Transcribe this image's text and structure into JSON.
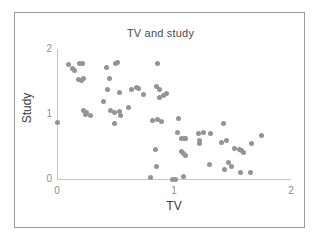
{
  "chart_data": {
    "type": "scatter",
    "title": "TV and study",
    "xlabel": "TV",
    "ylabel": "Study",
    "xlim": [
      0,
      2
    ],
    "ylim": [
      0,
      2
    ],
    "xticks": [
      "0",
      "1",
      "2"
    ],
    "xtick_values": [
      0,
      1,
      2
    ],
    "yticks": [
      "0",
      "1",
      "2"
    ],
    "ytick_values": [
      0,
      1,
      2
    ],
    "grid": false,
    "legend": null,
    "marker": {
      "shape": "circle",
      "color": "#949494",
      "size_px": 5
    },
    "n_points": 73,
    "points": [
      {
        "x": 0.0,
        "y": 0.87
      },
      {
        "x": 0.1,
        "y": 1.76
      },
      {
        "x": 0.13,
        "y": 1.7
      },
      {
        "x": 0.15,
        "y": 1.67
      },
      {
        "x": 0.19,
        "y": 1.78
      },
      {
        "x": 0.22,
        "y": 1.77
      },
      {
        "x": 0.18,
        "y": 1.53
      },
      {
        "x": 0.21,
        "y": 1.52
      },
      {
        "x": 0.23,
        "y": 1.55
      },
      {
        "x": 0.23,
        "y": 1.05
      },
      {
        "x": 0.24,
        "y": 1.0
      },
      {
        "x": 0.25,
        "y": 1.03
      },
      {
        "x": 0.29,
        "y": 0.97
      },
      {
        "x": 0.42,
        "y": 1.71
      },
      {
        "x": 0.5,
        "y": 1.78
      },
      {
        "x": 0.52,
        "y": 1.79
      },
      {
        "x": 0.45,
        "y": 1.54
      },
      {
        "x": 0.43,
        "y": 1.37
      },
      {
        "x": 0.4,
        "y": 1.2
      },
      {
        "x": 0.53,
        "y": 1.33
      },
      {
        "x": 0.46,
        "y": 1.05
      },
      {
        "x": 0.49,
        "y": 1.02
      },
      {
        "x": 0.53,
        "y": 1.04
      },
      {
        "x": 0.54,
        "y": 0.98
      },
      {
        "x": 0.49,
        "y": 0.85
      },
      {
        "x": 0.61,
        "y": 1.1
      },
      {
        "x": 0.64,
        "y": 1.38
      },
      {
        "x": 0.68,
        "y": 1.41
      },
      {
        "x": 0.7,
        "y": 1.4
      },
      {
        "x": 0.74,
        "y": 1.3
      },
      {
        "x": 0.86,
        "y": 1.78
      },
      {
        "x": 0.85,
        "y": 1.42
      },
      {
        "x": 0.88,
        "y": 1.38
      },
      {
        "x": 0.88,
        "y": 1.26
      },
      {
        "x": 0.91,
        "y": 1.29
      },
      {
        "x": 0.94,
        "y": 1.32
      },
      {
        "x": 0.82,
        "y": 0.9
      },
      {
        "x": 0.86,
        "y": 0.91
      },
      {
        "x": 0.89,
        "y": 0.89
      },
      {
        "x": 0.84,
        "y": 0.46
      },
      {
        "x": 0.85,
        "y": 0.19
      },
      {
        "x": 0.8,
        "y": 0.03
      },
      {
        "x": 0.99,
        "y": 0.0
      },
      {
        "x": 1.01,
        "y": 0.0
      },
      {
        "x": 1.08,
        "y": 0.04
      },
      {
        "x": 1.04,
        "y": 0.93
      },
      {
        "x": 1.03,
        "y": 0.72
      },
      {
        "x": 1.06,
        "y": 0.63
      },
      {
        "x": 1.09,
        "y": 0.62
      },
      {
        "x": 1.1,
        "y": 0.62
      },
      {
        "x": 1.06,
        "y": 0.42
      },
      {
        "x": 1.08,
        "y": 0.39
      },
      {
        "x": 1.1,
        "y": 0.36
      },
      {
        "x": 1.21,
        "y": 0.7
      },
      {
        "x": 1.25,
        "y": 0.71
      },
      {
        "x": 1.22,
        "y": 0.6
      },
      {
        "x": 1.22,
        "y": 0.55
      },
      {
        "x": 1.31,
        "y": 0.7
      },
      {
        "x": 1.3,
        "y": 0.22
      },
      {
        "x": 1.42,
        "y": 0.85
      },
      {
        "x": 1.41,
        "y": 0.56
      },
      {
        "x": 1.45,
        "y": 0.59
      },
      {
        "x": 1.43,
        "y": 0.15
      },
      {
        "x": 1.47,
        "y": 0.25
      },
      {
        "x": 1.49,
        "y": 0.19
      },
      {
        "x": 1.52,
        "y": 0.47
      },
      {
        "x": 1.56,
        "y": 0.45
      },
      {
        "x": 1.58,
        "y": 0.44
      },
      {
        "x": 1.59,
        "y": 0.41
      },
      {
        "x": 1.57,
        "y": 0.1
      },
      {
        "x": 1.66,
        "y": 0.55
      },
      {
        "x": 1.65,
        "y": 0.1
      },
      {
        "x": 1.75,
        "y": 0.67
      }
    ]
  }
}
